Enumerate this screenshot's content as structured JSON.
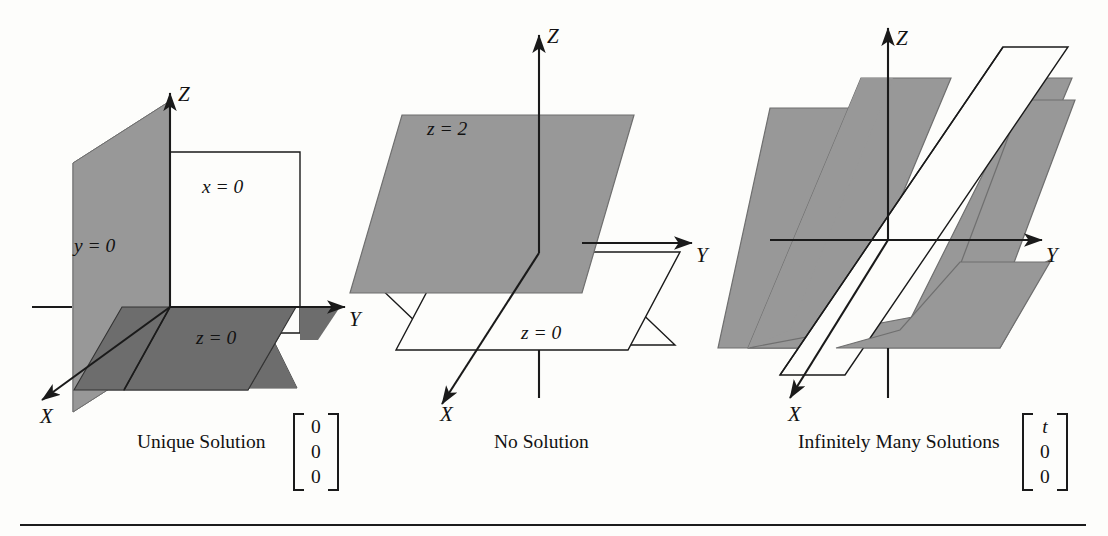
{
  "figure": {
    "title_absent": true,
    "background_color": "#fdfdfb",
    "shade_light": "#989898",
    "shade_dark": "#6d6d6d",
    "line_color": "#1a1a1a",
    "panels": [
      {
        "id": "unique-solution",
        "caption": "Unique Solution",
        "axis_labels": {
          "x": "X",
          "y": "Y",
          "z": "Z"
        },
        "plane_labels": [
          {
            "key": "x0",
            "text": "x = 0",
            "italic_var": "x",
            "value": "0",
            "fill": "white"
          },
          {
            "key": "y0",
            "text": "y = 0",
            "italic_var": "y",
            "value": "0",
            "fill": "#989898"
          },
          {
            "key": "z0",
            "text": "z = 0",
            "italic_var": "z",
            "value": "0",
            "fill": "#6d6d6d"
          }
        ],
        "solution_matrix": [
          "0",
          "0",
          "0"
        ],
        "solution_matrix_italic": [
          false,
          false,
          false
        ]
      },
      {
        "id": "no-solution",
        "caption": "No Solution",
        "axis_labels": {
          "x": "X",
          "y": "Y",
          "z": "Z"
        },
        "plane_labels": [
          {
            "key": "z2",
            "text": "z = 2",
            "italic_var": "z",
            "value": "2",
            "fill": "#989898"
          },
          {
            "key": "z0",
            "text": "z = 0",
            "italic_var": "z",
            "value": "0",
            "fill": "white"
          }
        ],
        "solution_matrix": [],
        "solution_matrix_italic": []
      },
      {
        "id": "infinitely-many-solutions",
        "caption": "Infinitely Many Solutions",
        "axis_labels": {
          "x": "X",
          "y": "Y",
          "z": "Z"
        },
        "plane_labels": [],
        "solution_matrix": [
          "t",
          "0",
          "0"
        ],
        "solution_matrix_italic": [
          true,
          false,
          false
        ]
      }
    ]
  },
  "labels": {
    "p1_x0": "x = 0",
    "p1_y0": "y = 0",
    "p1_z0": "z = 0",
    "p1_X": "X",
    "p1_Y": "Y",
    "p1_Z": "Z",
    "p1_caption": "Unique Solution",
    "p2_z2": "z = 2",
    "p2_z0": "z = 0",
    "p2_X": "X",
    "p2_Y": "Y",
    "p2_Z": "Z",
    "p2_caption": "No Solution",
    "p3_X": "X",
    "p3_Y": "Y",
    "p3_Z": "Z",
    "p3_caption": "Infinitely Many Solutions",
    "zero": "0",
    "t": "t"
  }
}
